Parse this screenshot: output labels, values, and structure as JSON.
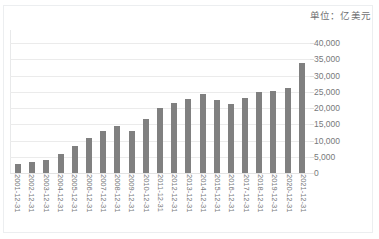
{
  "caption": {
    "unit_label": "单位：亿美元"
  },
  "chart_data": {
    "type": "bar",
    "title": "",
    "subtitle": "",
    "xlabel": "",
    "ylabel": "",
    "unit_note": "单位：亿美元",
    "grid": true,
    "legend": null,
    "ylim": [
      0,
      40000
    ],
    "ytick_labels": [
      "40,000",
      "35,000",
      "30,000",
      "25,000",
      "20,000",
      "15,000",
      "10,000",
      "5,000",
      "0"
    ],
    "ytick_values": [
      40000,
      35000,
      30000,
      25000,
      20000,
      15000,
      10000,
      5000,
      0
    ],
    "categories": [
      "2001-12-31",
      "2002-12-31",
      "2003-12-31",
      "2004-12-31",
      "2005-12-31",
      "2006-12-31",
      "2007-12-31",
      "2008-12-31",
      "2009-12-31",
      "2010-12-31",
      "2011-12-31",
      "2012-12-31",
      "2013-12-31",
      "2014-12-31",
      "2015-12-31",
      "2016-12-31",
      "2017-12-31",
      "2018-12-31",
      "2019-12-31",
      "2020-12-31",
      "2021-12-31"
    ],
    "values": [
      2700,
      3300,
      4000,
      6000,
      8200,
      10700,
      13000,
      14600,
      13000,
      16500,
      20000,
      21500,
      22700,
      24400,
      22600,
      21300,
      23000,
      24900,
      25200,
      26100,
      34000
    ],
    "bar_color": "#808080",
    "gridline_color": "#ebebeb",
    "plot_background": "#ffffff"
  }
}
